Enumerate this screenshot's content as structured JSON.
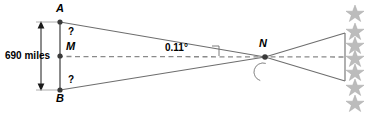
{
  "figure": {
    "colors": {
      "line": "#6e6e6e",
      "dashed": "#8a8a8a",
      "point": "#444444",
      "text": "#000000",
      "star": "#b9b9b9",
      "moon": "#9a9a9a"
    },
    "labels": {
      "point_a": "A",
      "point_b": "B",
      "point_m": "M",
      "point_n": "N",
      "unknown_top": "?",
      "unknown_bottom": "?",
      "distance": "690 miles",
      "angle": "0.11°"
    },
    "icons": {
      "moon": "crescent-moon-icon",
      "star": "star-icon",
      "star_count": 7
    },
    "geometry": {
      "a": [
        60,
        22
      ],
      "m": [
        60,
        56
      ],
      "b": [
        60,
        90
      ],
      "n": [
        265,
        57
      ],
      "right_top": [
        345,
        33
      ],
      "right_bottom": [
        345,
        81
      ],
      "dim_x": 41,
      "star_x": 355,
      "star_ys": [
        12,
        30,
        44,
        57,
        71,
        86,
        102
      ]
    }
  }
}
